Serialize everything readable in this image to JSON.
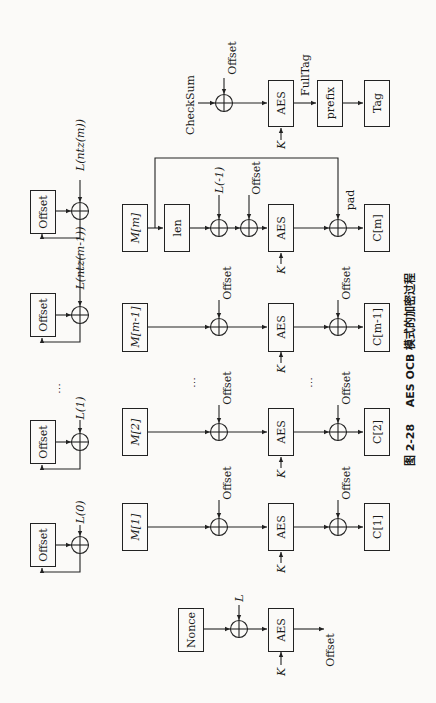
{
  "figure": {
    "orientation": "rotated 90 degrees counter-clockwise",
    "caption": {
      "number": "图 2-28",
      "title": "AES OCB 模式的加密过程"
    }
  },
  "offset_update_chain": [
    {
      "box": "Offset",
      "input": "L(0)"
    },
    {
      "box": "Offset",
      "input": "L(1)"
    },
    {
      "ellipsis": "⋯"
    },
    {
      "box": "Offset",
      "input": "L(ntz(m-1))"
    },
    {
      "box": "Offset",
      "input": "L(ntz(m))"
    }
  ],
  "nonce_block": {
    "input": "Nonce",
    "xor_input": "L",
    "cipher": "AES",
    "key": "K",
    "output": "Offset"
  },
  "blocks": [
    {
      "input": "M[1]",
      "pre_xor": "Offset",
      "cipher": "AES",
      "key": "K",
      "post_xor": "Offset",
      "output": "C[1]"
    },
    {
      "input": "M[2]",
      "pre_xor": "Offset",
      "cipher": "AES",
      "key": "K",
      "post_xor": "Offset",
      "output": "C[2]"
    },
    {
      "input": "M[m-1]",
      "pre_xor": "Offset",
      "cipher": "AES",
      "key": "K",
      "post_xor": "Offset",
      "output": "C[m-1]"
    }
  ],
  "final_block": {
    "input": "M[m]",
    "len_box": "len",
    "xor1": "L(-1)",
    "xor2": "Offset",
    "cipher": "AES",
    "key": "K",
    "pad_label": "pad",
    "output": "C[m]"
  },
  "tag_block": {
    "input": "CheckSum",
    "xor": "Offset",
    "cipher": "AES",
    "key": "K",
    "fulltag_label": "FullTag",
    "prefix_box": "prefix",
    "output": "Tag"
  },
  "ellipsis": "⋯"
}
